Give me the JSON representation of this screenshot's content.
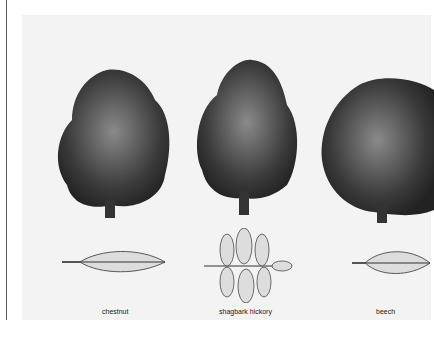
{
  "figure": {
    "trees": [
      {
        "name": "chestnut",
        "label": "chestnut"
      },
      {
        "name": "shagbark-hickory",
        "label": "shagbark hickory"
      },
      {
        "name": "beech",
        "label": "beech"
      }
    ]
  },
  "colors": {
    "background": "#ffffff",
    "panel": "#f3f3f3",
    "ink": "#222222"
  }
}
